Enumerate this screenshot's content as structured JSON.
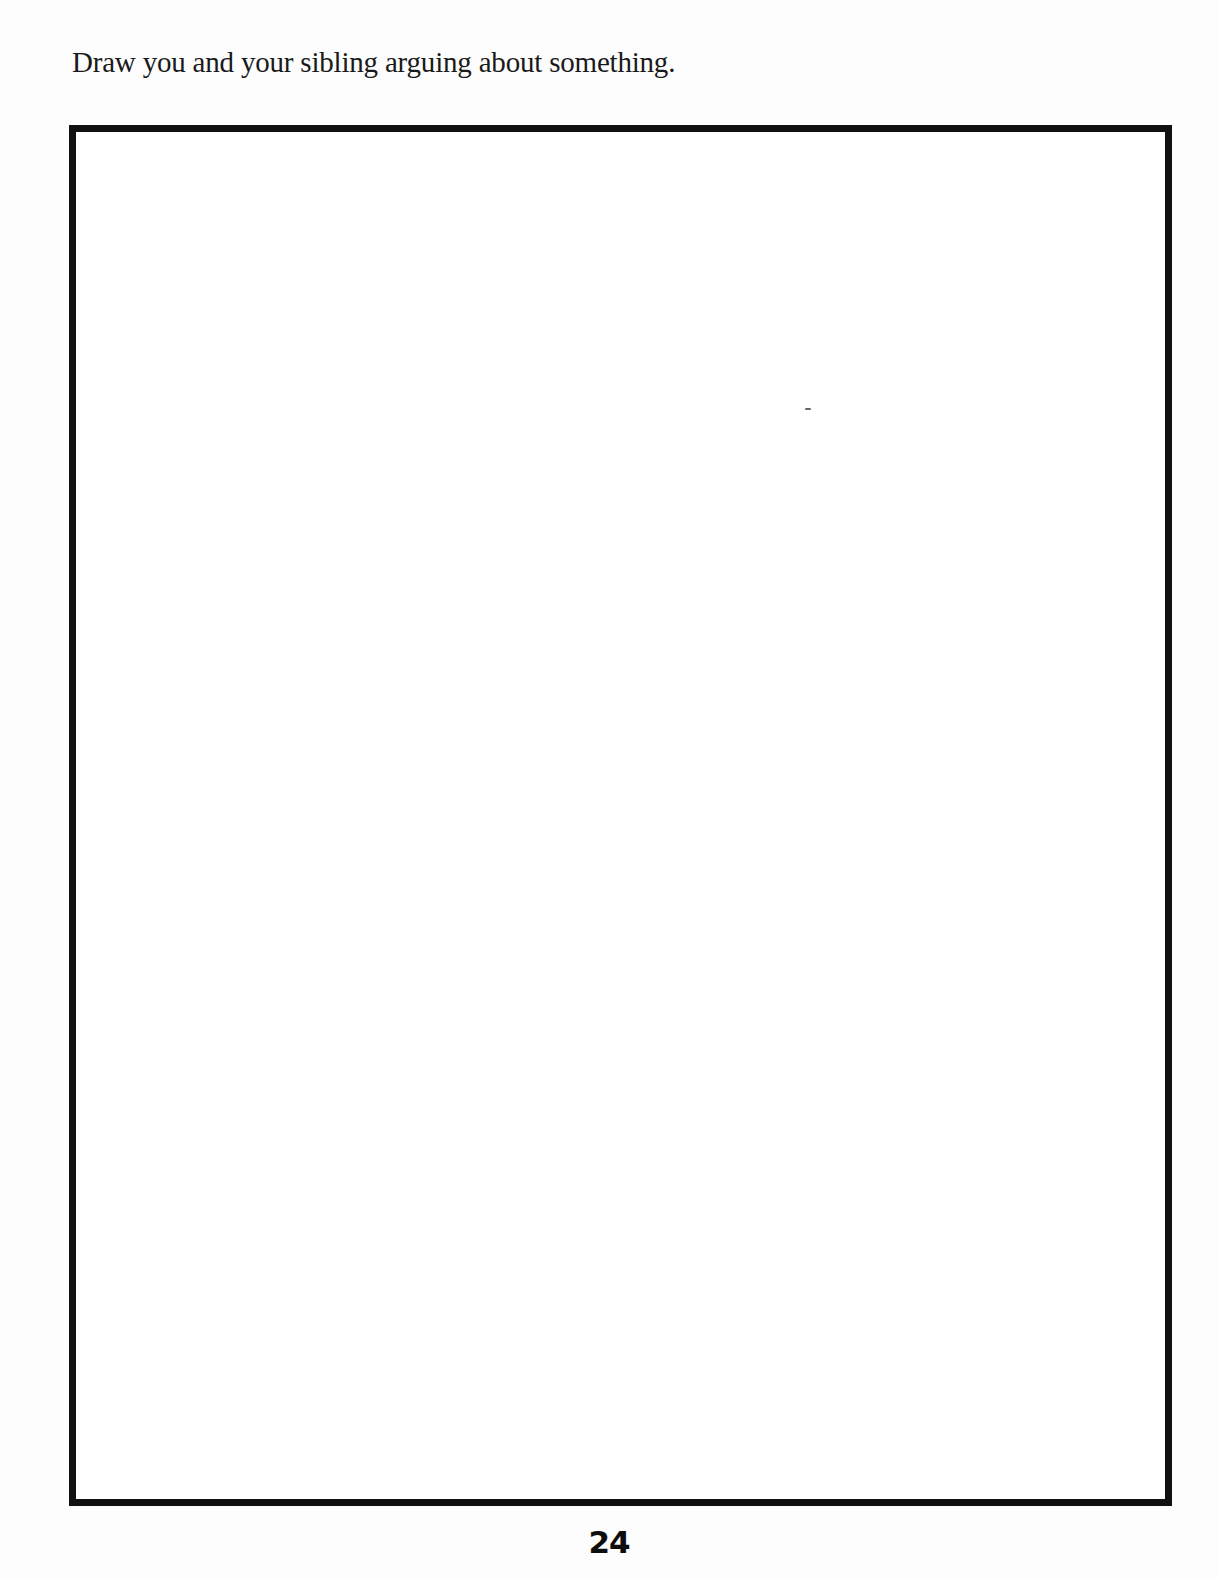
{
  "page": {
    "prompt": "Draw you and your sibling arguing about something.",
    "drawing_area": {
      "content": "",
      "border_color": "#111111"
    },
    "page_number": "24"
  }
}
